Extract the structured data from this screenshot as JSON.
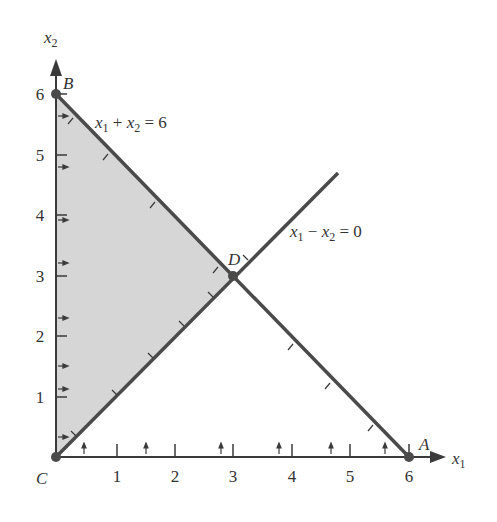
{
  "figure": {
    "type": "linear-programming-feasible-region",
    "axes": {
      "x_label": "x",
      "x_label_sub": "1",
      "y_label": "x",
      "y_label_sub": "2",
      "x_ticks": [
        "1",
        "2",
        "3",
        "4",
        "5",
        "6"
      ],
      "y_ticks": [
        "1",
        "2",
        "3",
        "4",
        "5",
        "6"
      ]
    },
    "constraints": [
      {
        "id": "c1",
        "label_parts": [
          "x",
          "1",
          " + ",
          "x",
          "2",
          " = 6"
        ],
        "equation": "x1 + x2 = 6"
      },
      {
        "id": "c2",
        "label_parts": [
          "x",
          "1",
          " − ",
          "x",
          "2",
          " = 0"
        ],
        "equation": "x1 - x2 = 0"
      }
    ],
    "points": [
      {
        "name": "A",
        "x": 6,
        "y": 0
      },
      {
        "name": "B",
        "x": 0,
        "y": 6
      },
      {
        "name": "C",
        "x": 0,
        "y": 0
      },
      {
        "name": "D",
        "x": 3,
        "y": 3
      }
    ],
    "feasible_region": {
      "vertices": [
        "C",
        "B",
        "D"
      ],
      "fill": "#d4d4d4"
    },
    "colors": {
      "line": "#4a4a4a",
      "text": "#333333",
      "region": "#d4d4d4"
    }
  }
}
